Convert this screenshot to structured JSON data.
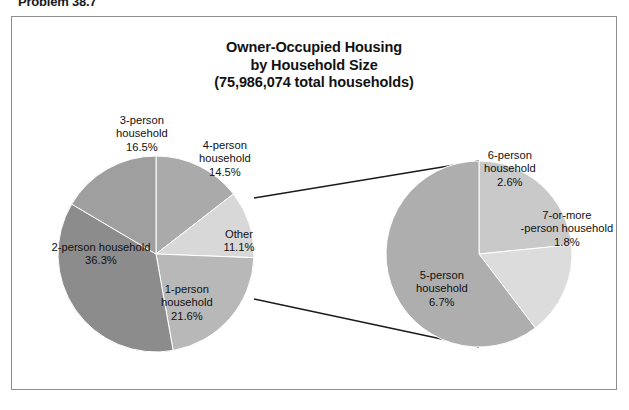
{
  "top_caption": "Problem 38.7",
  "chart_title": {
    "line1": "Owner-Occupied Housing",
    "line2": "by Household Size",
    "line3": "(75,986,074 total households)"
  },
  "chart_data": {
    "type": "pie",
    "title": "Owner-Occupied Housing by Household Size (75,986,074 total households)",
    "subtitle": "75,986,074 total households",
    "total_households": "75,986,074",
    "units": "percent of total households",
    "legend": "none",
    "grid": false,
    "main_pie": {
      "name": "Owner-Occupied Housing by Household Size",
      "center": [
        155,
        253
      ],
      "radius": 98,
      "start_angle_deg": 0,
      "direction": "clockwise",
      "categories": [
        "4-person household",
        "Other",
        "1-person household",
        "2-person household",
        "3-person household"
      ],
      "values": [
        14.5,
        11.1,
        21.6,
        36.3,
        16.5
      ],
      "slices": [
        {
          "label_line1": "4-person",
          "label_line2": "household",
          "label_value": "14.5%",
          "value": 14.5,
          "color": "#aaaaaa",
          "label_x": 224,
          "label_y": 158
        },
        {
          "label_line1": "Other",
          "label_line2": "",
          "label_value": "11.1%",
          "value": 11.1,
          "color": "#d8d8d8",
          "label_x": 238,
          "label_y": 240
        },
        {
          "label_line1": "1-person",
          "label_line2": "household",
          "label_value": "21.6%",
          "value": 21.6,
          "color": "#b8b8b8",
          "label_x": 186,
          "label_y": 302
        },
        {
          "label_line1": "2-person household",
          "label_line2": "",
          "label_value": "36.3%",
          "value": 36.3,
          "color": "#8c8c8c",
          "label_x": 100,
          "label_y": 253
        },
        {
          "label_line1": "3-person",
          "label_line2": "household",
          "label_value": "16.5%",
          "value": 16.5,
          "color": "#9f9f9f",
          "label_x": 141,
          "label_y": 133
        }
      ]
    },
    "sub_pie": {
      "name": "Other (breakdown)",
      "parent_slice": "Other",
      "parent_value": 11.1,
      "center": [
        478,
        253
      ],
      "radius": 93,
      "start_angle_deg": 0,
      "direction": "clockwise",
      "categories": [
        "6-person household",
        "7-or-more-person household",
        "5-person household"
      ],
      "values": [
        2.6,
        1.8,
        6.7
      ],
      "slices": [
        {
          "label_line1": "6-person",
          "label_line2": "household",
          "label_value": "2.6%",
          "value": 2.6,
          "color": "#c9c9c9",
          "label_x": 509,
          "label_y": 168
        },
        {
          "label_line1": "7-or-more",
          "label_line2": "-person household",
          "label_value": "1.8%",
          "value": 1.8,
          "color": "#dcdcdc",
          "label_x": 566,
          "label_y": 228
        },
        {
          "label_line1": "5-person",
          "label_line2": "household",
          "label_value": "6.7%",
          "value": 6.7,
          "color": "#aeaeae",
          "label_x": 441,
          "label_y": 288
        }
      ]
    },
    "connectors": [
      {
        "from": [
          253,
          197
        ],
        "to": [
          478,
          160
        ]
      },
      {
        "from": [
          253,
          298
        ],
        "to": [
          478,
          346
        ]
      }
    ]
  },
  "colors": {
    "frame_border": "#8e8e8e",
    "background": "#ffffff",
    "text": "#111111",
    "connector_line": "#1a1a1a",
    "slice_outline": "#ffffff"
  }
}
